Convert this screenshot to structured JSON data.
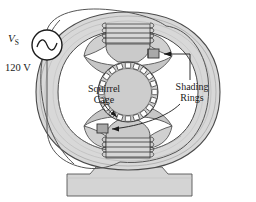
{
  "figure": {
    "type": "engineering-diagram"
  },
  "labels": {
    "source_symbol": "V",
    "source_subscript": "S",
    "source_voltage": "120 V",
    "rotor_line1": "Squirrel",
    "rotor_line2": "Cage",
    "shading_line1": "Shading",
    "shading_line2": "Rings"
  },
  "colors": {
    "outline": "#4a4a4a",
    "ink": "#1a1a1a",
    "frame_fill": "#d2d2d2",
    "frame_fill_light": "#dcdcdc",
    "pole_fill": "#cacaca",
    "rotor_fill": "#cfcfcf",
    "base_fill": "#d4d4d4",
    "shading_ring_fill": "#a9a9a9",
    "paper": "#ffffff",
    "wire": "#555555"
  },
  "components": {
    "ac_source": {
      "name": "AC voltage source",
      "waveform": "sine"
    },
    "rotor": {
      "name": "Squirrel cage rotor",
      "bar_count": 20
    },
    "field_coils": [
      {
        "position": "top",
        "turn_count": 4
      },
      {
        "position": "bottom",
        "turn_count": 4
      }
    ],
    "shading_rings": [
      {
        "position": "upper-right-pole"
      },
      {
        "position": "lower-left-pole"
      }
    ],
    "frame": {
      "name": "Laminated stator frame",
      "shape": "oval-ring"
    },
    "base": {
      "name": "Mounting base pedestal"
    }
  }
}
